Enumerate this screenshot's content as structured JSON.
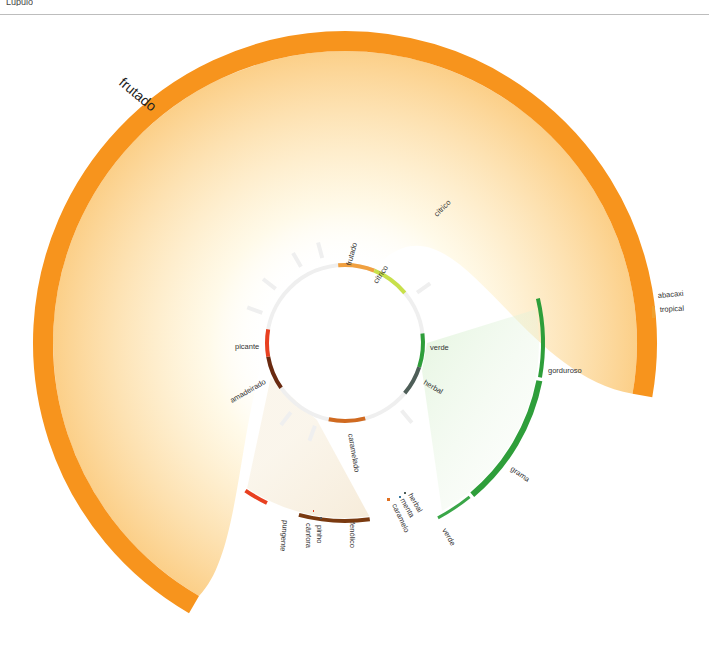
{
  "header": {
    "cut_text": "Lúpulo"
  },
  "center": [
    345,
    343
  ],
  "inner_ring": {
    "radius": 78,
    "width": 4,
    "base_color": "#efefef",
    "segments": [
      {
        "label": "frutado",
        "start": -5,
        "end": 22,
        "color": "#f0a040"
      },
      {
        "label": "cítrico",
        "start": 22,
        "end": 50,
        "color": "#c8e04a"
      },
      {
        "label": "verde",
        "start": 83,
        "end": 108,
        "color": "#2e9e3a"
      },
      {
        "label": "herbal",
        "start": 108,
        "end": 130,
        "color": "#4e5e58"
      },
      {
        "label": "caramelado",
        "start": 165,
        "end": 192,
        "color": "#d06a20"
      },
      {
        "label": "amadeirado",
        "start": 235,
        "end": 260,
        "color": "#6a2a10"
      },
      {
        "label": "picante",
        "start": 260,
        "end": 280,
        "color": "#e84020"
      }
    ],
    "stubs": [
      -30,
      -15,
      -52,
      -70,
      55,
      140,
      200,
      218
    ]
  },
  "outer_arcs": [
    {
      "label": "frutado",
      "radius": 302,
      "width": 20,
      "start": 210,
      "end": 460,
      "color": "#f7941d",
      "label_pos": [
        118,
        84
      ],
      "label_angle": 40,
      "big": true
    },
    {
      "label": "abacaxi",
      "radius": 0,
      "color": "#f7941d",
      "marker": [
        651,
        297,
        2,
        2
      ],
      "label_pos": [
        658,
        298
      ],
      "label_angle": -5
    },
    {
      "label": "tropical",
      "radius": 0,
      "color": "#f0a030",
      "marker": [
        652,
        306,
        3,
        12
      ],
      "label_pos": [
        660,
        312
      ],
      "label_angle": -3
    },
    {
      "label": "gorduroso",
      "radius": 198,
      "width": 4,
      "start": 77,
      "end": 100,
      "color": "#2e9e3a",
      "label_pos": [
        548,
        373
      ],
      "label_angle": 0
    },
    {
      "label": "grama",
      "radius": 198,
      "width": 6,
      "start": 101,
      "end": 140,
      "color": "#2e9e3a",
      "label_pos": [
        510,
        470
      ],
      "label_angle": 35
    },
    {
      "label": "verde",
      "radius": 198,
      "width": 3,
      "start": 141,
      "end": 152,
      "color": "#3aa648",
      "label_pos": [
        442,
        530
      ],
      "label_angle": 60
    },
    {
      "label": "herbal",
      "radius": 0,
      "color": "#4e5e58",
      "marker": [
        404,
        492,
        2,
        2
      ],
      "label_pos": [
        408,
        495
      ],
      "label_angle": 60
    },
    {
      "label": "menta",
      "radius": 0,
      "color": "#3a7aa0",
      "marker": [
        399,
        496,
        2,
        2
      ],
      "label_pos": [
        400,
        500
      ],
      "label_angle": 60
    },
    {
      "label": "caramelo",
      "radius": 0,
      "color": "#e07020",
      "marker": [
        387,
        498,
        3,
        3
      ],
      "label_pos": [
        392,
        505
      ],
      "label_angle": 65
    },
    {
      "label": "fenólico",
      "radius": 178,
      "width": 4,
      "start": 172,
      "end": 195,
      "color": "#7a3a10",
      "label_pos": [
        350,
        522
      ],
      "label_angle": 90
    },
    {
      "label": "pinho",
      "radius": 0,
      "color": "#555555",
      "marker": [
        320,
        517,
        2,
        2
      ],
      "label_pos": [
        317,
        525
      ],
      "label_angle": 90
    },
    {
      "label": "cânfora",
      "radius": 0,
      "color": "#e84020",
      "marker": [
        313,
        510,
        1,
        2
      ],
      "label_pos": [
        306,
        523
      ],
      "label_angle": 90
    },
    {
      "label": "pungente",
      "radius": 178,
      "width": 4,
      "start": 206,
      "end": 214,
      "color": "#e84020",
      "label_pos": [
        283,
        520
      ],
      "label_angle": 95
    }
  ],
  "inner_labels": [
    {
      "text": "frutado",
      "pos": [
        351,
        266
      ],
      "angle": -75
    },
    {
      "text": "cítrico",
      "pos": [
        377,
        284
      ],
      "angle": -55
    },
    {
      "text": "verde",
      "pos": [
        430,
        350
      ],
      "angle": 0
    },
    {
      "text": "herbal",
      "pos": [
        423,
        384
      ],
      "angle": 30
    },
    {
      "text": "caramelado",
      "pos": [
        348,
        434
      ],
      "angle": 80
    },
    {
      "text": "amadeirado",
      "pos": [
        232,
        403
      ],
      "angle": -30
    },
    {
      "text": "picante",
      "pos": [
        235,
        349
      ],
      "angle": 0
    },
    {
      "text": "cítrico",
      "pos": [
        437,
        217
      ],
      "angle": -45
    }
  ]
}
